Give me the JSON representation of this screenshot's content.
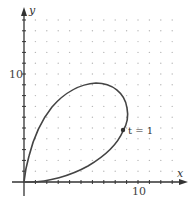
{
  "chart_data": {
    "type": "line",
    "title": "",
    "xlabel": "x",
    "ylabel": "y",
    "x_tick_labels": [
      "10"
    ],
    "y_tick_labels": [
      "10"
    ],
    "xlim": [
      -0.5,
      14
    ],
    "ylim": [
      -1.5,
      16
    ],
    "grid": "dotted lattice, 1-unit spacing",
    "annotations": [
      {
        "text": "t = 1",
        "x": 8.8,
        "y": 4.8
      }
    ],
    "series": [
      {
        "name": "parametric curve",
        "x": [
          0,
          0.35,
          1.05,
          2.3,
          4.0,
          6.2,
          8.0,
          8.9,
          8.8,
          7.6,
          5.8,
          3.2,
          1.0,
          0
        ],
        "y": [
          0,
          2.0,
          4.8,
          6.8,
          8.5,
          9.1,
          8.5,
          6.8,
          4.8,
          2.9,
          1.4,
          0.4,
          0.05,
          0
        ]
      }
    ]
  },
  "labels": {
    "x_axis": "x",
    "y_axis": "y",
    "x_tick": "10",
    "y_tick": "10",
    "point": "t = 1"
  }
}
